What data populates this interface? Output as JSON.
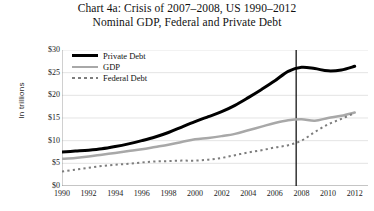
{
  "chart_data": {
    "type": "line",
    "title": "Chart 4a: Crisis of 2007–2008, US 1990–2012",
    "subtitle": "Nominal GDP, Federal and Private Debt",
    "xlabel": "",
    "ylabel": "In trillions",
    "xlim": [
      1990,
      2013
    ],
    "ylim": [
      0,
      30
    ],
    "grid": true,
    "legend_position": "top-left",
    "y_tick_labels": [
      "$0",
      "$5",
      "$10",
      "$15",
      "$20",
      "$25",
      "$30"
    ],
    "y_tick_values": [
      0,
      5,
      10,
      15,
      20,
      25,
      30
    ],
    "x_tick_labels": [
      "1990",
      "1992",
      "1994",
      "1996",
      "1998",
      "2000",
      "2002",
      "2004",
      "2006",
      "2008",
      "2010",
      "2012"
    ],
    "x_tick_values": [
      1990,
      1992,
      1994,
      1996,
      1998,
      2000,
      2002,
      2004,
      2006,
      2008,
      2010,
      2012
    ],
    "annotations": [
      {
        "name": "crisis-marker",
        "type": "vline",
        "x": 2007.6,
        "label": ""
      }
    ],
    "x": [
      1990,
      1991,
      1992,
      1993,
      1994,
      1995,
      1996,
      1997,
      1998,
      1999,
      2000,
      2001,
      2002,
      2003,
      2004,
      2005,
      2006,
      2007,
      2008,
      2009,
      2010,
      2011,
      2012
    ],
    "series": [
      {
        "name": "Private Debt",
        "color": "#000000",
        "style": "solid",
        "width": 3,
        "values": [
          7.5,
          7.7,
          7.9,
          8.2,
          8.7,
          9.3,
          10.0,
          10.8,
          11.8,
          13.0,
          14.2,
          15.3,
          16.4,
          17.8,
          19.5,
          21.3,
          23.2,
          25.3,
          26.2,
          25.9,
          25.4,
          25.6,
          26.4
        ]
      },
      {
        "name": "GDP",
        "color": "#a8a8a8",
        "style": "solid",
        "width": 2.5,
        "values": [
          6.0,
          6.2,
          6.5,
          6.9,
          7.3,
          7.7,
          8.1,
          8.6,
          9.1,
          9.7,
          10.3,
          10.6,
          11.0,
          11.5,
          12.3,
          13.1,
          13.9,
          14.5,
          14.7,
          14.4,
          15.0,
          15.5,
          16.2
        ]
      },
      {
        "name": "Federal Debt",
        "color": "#7d7d7d",
        "style": "dashed",
        "width": 2,
        "values": [
          3.2,
          3.6,
          4.0,
          4.4,
          4.7,
          4.9,
          5.2,
          5.4,
          5.5,
          5.6,
          5.6,
          5.8,
          6.2,
          6.8,
          7.4,
          7.9,
          8.5,
          9.0,
          10.0,
          11.9,
          13.6,
          14.8,
          16.1
        ]
      }
    ]
  }
}
